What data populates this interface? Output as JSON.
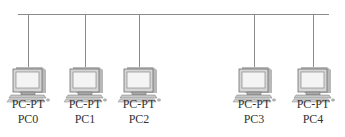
{
  "diagram": {
    "type": "bus-topology",
    "bus": {
      "color": "#8a8a8a"
    },
    "nodes": [
      {
        "type": "PC-PT",
        "name": "PC0",
        "icon": "desktop-pc-icon",
        "x": 6
      },
      {
        "type": "PC-PT",
        "name": "PC1",
        "icon": "desktop-pc-icon",
        "x": 63
      },
      {
        "type": "PC-PT",
        "name": "PC2",
        "icon": "desktop-pc-icon",
        "x": 117
      },
      {
        "type": "PC-PT",
        "name": "PC3",
        "icon": "desktop-pc-icon",
        "x": 232
      },
      {
        "type": "PC-PT",
        "name": "PC4",
        "icon": "desktop-pc-icon",
        "x": 291
      }
    ]
  }
}
